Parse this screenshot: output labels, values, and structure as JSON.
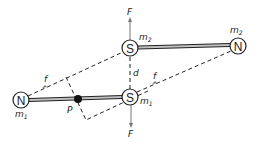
{
  "diagram": {
    "nodes": {
      "s_upper": {
        "letter": "S",
        "mass": "m",
        "mass_sub": "2"
      },
      "n_upper": {
        "letter": "N",
        "mass": "m",
        "mass_sub": "2"
      },
      "s_lower": {
        "letter": "S",
        "mass": "m",
        "mass_sub": "1"
      },
      "n_lower": {
        "letter": "N",
        "mass": "m",
        "mass_sub": "1"
      }
    },
    "labels": {
      "force_top": "F",
      "force_bottom": "F",
      "distance": "d",
      "f_left": "f",
      "f_right": "f",
      "pivot": "P"
    },
    "colors": {
      "stroke": "#222222",
      "rod_fill": "#b0b0b0",
      "arrow": "#777777"
    }
  }
}
